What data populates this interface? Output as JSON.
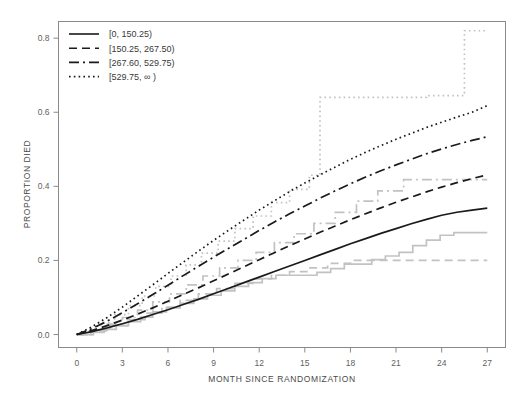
{
  "chart_data": {
    "type": "line",
    "title": "",
    "xlabel": "MONTH SINCE RANDOMIZATION",
    "ylabel": "PROPORTION DIED",
    "xlim": [
      -1.2,
      28.2
    ],
    "ylim": [
      -0.035,
      0.845
    ],
    "xticks": [
      0,
      3,
      6,
      9,
      12,
      15,
      18,
      21,
      24,
      27
    ],
    "xticklabels": [
      "0",
      "3",
      "6",
      "9",
      "12",
      "15",
      "18",
      "21",
      "24",
      "27"
    ],
    "yticks": [
      0.0,
      0.2,
      0.4,
      0.6,
      0.8
    ],
    "yticklabels": [
      "0.0",
      "0.2",
      "0.4",
      "0.6",
      "0.8"
    ],
    "grid": false,
    "legend_position": "top-left",
    "series": [
      {
        "name": "[0, 150.25)",
        "style": "solid",
        "color": "#1a1a1a",
        "km_color": "#c2c2c2",
        "x": [
          0,
          1,
          2,
          3,
          4,
          5,
          6,
          7,
          8,
          9,
          10,
          11,
          12,
          13,
          14,
          15,
          16,
          17,
          18,
          19,
          20,
          21,
          22,
          23,
          24,
          25,
          26,
          27
        ],
        "values": [
          0.0,
          0.008,
          0.018,
          0.029,
          0.041,
          0.054,
          0.067,
          0.081,
          0.095,
          0.11,
          0.125,
          0.14,
          0.155,
          0.17,
          0.185,
          0.2,
          0.215,
          0.23,
          0.245,
          0.259,
          0.273,
          0.286,
          0.299,
          0.311,
          0.322,
          0.33,
          0.336,
          0.341
        ],
        "km_x": [
          0,
          0.9,
          1.8,
          2.6,
          3.4,
          4.2,
          5.0,
          5.9,
          6.8,
          7.7,
          8.6,
          9.5,
          10.4,
          11.3,
          12.2,
          13.1,
          14.0,
          14.9,
          15.8,
          16.7,
          17.6,
          18.5,
          19.4,
          20.3,
          21.2,
          22.1,
          23.0,
          23.9,
          24.8,
          27
        ],
        "km_values": [
          0.0,
          0.006,
          0.014,
          0.024,
          0.035,
          0.047,
          0.061,
          0.072,
          0.084,
          0.096,
          0.106,
          0.118,
          0.13,
          0.14,
          0.151,
          0.16,
          0.16,
          0.16,
          0.168,
          0.178,
          0.19,
          0.19,
          0.202,
          0.212,
          0.222,
          0.24,
          0.255,
          0.268,
          0.275,
          0.275
        ]
      },
      {
        "name": "[150.25, 267.50)",
        "style": "dashed",
        "color": "#1a1a1a",
        "km_color": "#c2c2c2",
        "x": [
          0,
          1,
          2,
          3,
          4,
          5,
          6,
          7,
          8,
          9,
          10,
          11,
          12,
          13,
          14,
          15,
          16,
          17,
          18,
          19,
          20,
          21,
          22,
          23,
          24,
          25,
          26,
          27
        ],
        "values": [
          0.0,
          0.011,
          0.024,
          0.039,
          0.055,
          0.072,
          0.09,
          0.108,
          0.126,
          0.145,
          0.164,
          0.183,
          0.202,
          0.221,
          0.24,
          0.258,
          0.276,
          0.293,
          0.31,
          0.326,
          0.342,
          0.357,
          0.371,
          0.385,
          0.398,
          0.41,
          0.421,
          0.431
        ],
        "km_x": [
          0,
          1.1,
          2.2,
          3.3,
          4.5,
          5.6,
          6.8,
          8.0,
          9.2,
          10.4,
          11.6,
          12.8,
          14.0,
          15.2,
          16.5,
          18.0,
          19.5,
          21.0,
          27
        ],
        "km_values": [
          0.0,
          0.01,
          0.024,
          0.04,
          0.058,
          0.074,
          0.092,
          0.11,
          0.124,
          0.138,
          0.15,
          0.16,
          0.17,
          0.18,
          0.192,
          0.2,
          0.2,
          0.2,
          0.2
        ]
      },
      {
        "name": "[267.60, 529.75)",
        "style": "dashdot",
        "color": "#1a1a1a",
        "km_color": "#c2c2c2",
        "x": [
          0,
          1,
          2,
          3,
          4,
          5,
          6,
          7,
          8,
          9,
          10,
          11,
          12,
          13,
          14,
          15,
          16,
          17,
          18,
          19,
          20,
          21,
          22,
          23,
          24,
          25,
          26,
          27
        ],
        "values": [
          0.0,
          0.016,
          0.036,
          0.059,
          0.083,
          0.108,
          0.133,
          0.159,
          0.184,
          0.209,
          0.233,
          0.257,
          0.281,
          0.304,
          0.326,
          0.347,
          0.368,
          0.388,
          0.407,
          0.425,
          0.442,
          0.458,
          0.473,
          0.488,
          0.501,
          0.513,
          0.524,
          0.534
        ],
        "km_x": [
          0,
          1.0,
          2.0,
          3.0,
          4.0,
          5.0,
          6.1,
          7.2,
          8.3,
          9.4,
          10.6,
          11.8,
          13.0,
          14.3,
          15.6,
          17.0,
          18.4,
          19.8,
          21.5,
          23.5,
          27
        ],
        "km_values": [
          0.0,
          0.012,
          0.028,
          0.046,
          0.066,
          0.088,
          0.11,
          0.134,
          0.158,
          0.18,
          0.2,
          0.222,
          0.248,
          0.272,
          0.3,
          0.33,
          0.36,
          0.388,
          0.418,
          0.418,
          0.418
        ]
      },
      {
        "name": "[529.75, ∞ )",
        "style": "dotted",
        "color": "#1a1a1a",
        "km_color": "#c2c2c2",
        "x": [
          0,
          1,
          2,
          3,
          4,
          5,
          6,
          7,
          8,
          9,
          10,
          11,
          12,
          13,
          14,
          15,
          16,
          17,
          18,
          19,
          20,
          21,
          22,
          23,
          24,
          25,
          26,
          27
        ],
        "values": [
          0.0,
          0.021,
          0.046,
          0.074,
          0.104,
          0.134,
          0.165,
          0.195,
          0.225,
          0.254,
          0.282,
          0.309,
          0.336,
          0.361,
          0.386,
          0.409,
          0.431,
          0.452,
          0.473,
          0.492,
          0.51,
          0.527,
          0.543,
          0.559,
          0.573,
          0.587,
          0.6,
          0.618
        ],
        "km_x": [
          0,
          0.8,
          1.6,
          2.5,
          3.4,
          4.3,
          5.2,
          6.2,
          7.2,
          8.2,
          9.3,
          10.4,
          11.6,
          12.8,
          14.0,
          15.3,
          16.0,
          16.0,
          18.0,
          20.5,
          23.0,
          25.5,
          25.5,
          27
        ],
        "km_values": [
          0.0,
          0.014,
          0.032,
          0.054,
          0.078,
          0.104,
          0.13,
          0.158,
          0.188,
          0.22,
          0.252,
          0.286,
          0.32,
          0.356,
          0.392,
          0.43,
          0.43,
          0.64,
          0.64,
          0.64,
          0.645,
          0.645,
          0.82,
          0.82
        ]
      }
    ]
  },
  "legend": {
    "entries": [
      {
        "label": "[0, 150.25)"
      },
      {
        "label": "[150.25, 267.50)"
      },
      {
        "label": "[267.60, 529.75)"
      },
      {
        "label": "[529.75, ∞ )"
      }
    ]
  }
}
